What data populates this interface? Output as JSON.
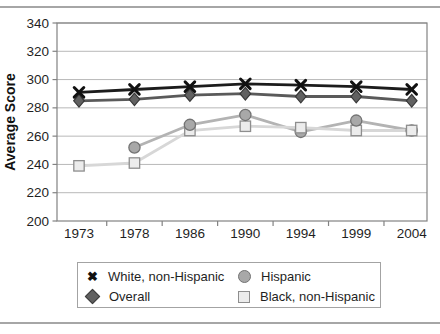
{
  "chart_data": {
    "type": "line",
    "title": "",
    "xlabel": "",
    "ylabel": "Average Score",
    "categories": [
      "1973",
      "1978",
      "1986",
      "1990",
      "1994",
      "1999",
      "2004"
    ],
    "ylim": [
      200,
      340
    ],
    "ytick_step": 20,
    "grid": true,
    "legend_position": "bottom",
    "series": [
      {
        "name": "White, non-Hispanic",
        "marker": "x",
        "line_color": "#1c1c1c",
        "marker_color": "#111111",
        "values": [
          291,
          293,
          295,
          297,
          296,
          295,
          293
        ]
      },
      {
        "name": "Overall",
        "marker": "diamond",
        "line_color": "#5a5a5a",
        "marker_fill": "#616161",
        "marker_stroke": "#383838",
        "values": [
          285,
          286,
          289,
          290,
          288,
          288,
          285
        ]
      },
      {
        "name": "Hispanic",
        "marker": "circle",
        "line_color": "#b3b3b3",
        "marker_fill": "#a8a8a8",
        "marker_stroke": "#737373",
        "values": [
          null,
          252,
          268,
          275,
          263,
          271,
          264
        ]
      },
      {
        "name": "Black, non-Hispanic",
        "marker": "square",
        "line_color": "#d7d7d7",
        "marker_fill": "#ececec",
        "marker_stroke": "#8e8e8e",
        "values": [
          239,
          241,
          264,
          267,
          266,
          264,
          264
        ]
      }
    ]
  },
  "legend": {
    "x_glyph": "✖"
  },
  "colors": {
    "grid": "#b8b8b8",
    "axis": "#828282",
    "text": "#1f1f1f",
    "rule": "#a6a6a6",
    "background": "#ffffff"
  }
}
